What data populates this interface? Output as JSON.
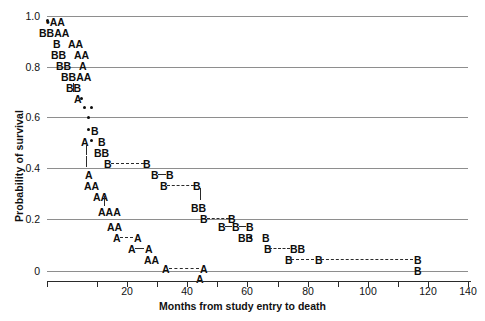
{
  "chart_data": {
    "type": "scatter",
    "title": "",
    "xlabel": "Months from study entry to death",
    "ylabel": "Probability of survival",
    "xlim": [
      0,
      140
    ],
    "ylim": [
      0,
      1.0
    ],
    "grid": true,
    "legend": "none",
    "x_ticks_major": [
      0,
      20,
      40,
      60,
      80,
      100,
      120,
      140
    ],
    "x_tick_labels": [
      "",
      "20",
      "40",
      "60",
      "80",
      "100",
      "120",
      "140"
    ],
    "x_ticks_minor_step": 10,
    "y_ticks": [
      0,
      0.2,
      0.4,
      0.6,
      0.8,
      1.0
    ],
    "y_tick_labels": [
      "0",
      "0.2",
      "0.4",
      "0.6",
      "0.8",
      "1.0"
    ],
    "series": [
      {
        "name": "A",
        "marker": "letter-A"
      },
      {
        "name": "B",
        "marker": "letter-B"
      },
      {
        "name": "dot",
        "marker": "filled-circle"
      }
    ],
    "rows": [
      {
        "y": 0.96,
        "text": "•AA",
        "x": 5
      },
      {
        "y": 0.92,
        "text": "BBAA",
        "x": 3
      },
      {
        "y": 0.88,
        "text": "B  AA",
        "x": 6
      },
      {
        "y": 0.84,
        "text": "BB  AA",
        "x": 7
      },
      {
        "y": 0.8,
        "text": "BB  A",
        "x": 8
      },
      {
        "y": 0.76,
        "text": "BBAA",
        "x": 11
      },
      {
        "y": 0.72,
        "text": "BB|",
        "x": 13
      },
      {
        "y": 0.68,
        "text": "A•",
        "x": 15
      },
      {
        "y": 0.645,
        "text": "••",
        "x": 17
      },
      {
        "y": 0.6,
        "text": "•",
        "x": 17
      },
      {
        "y": 0.565,
        "text": "•B",
        "x": 18
      },
      {
        "y": 0.525,
        "text": "A•B",
        "x": 17
      },
      {
        "y": 0.485,
        "text": "|BB",
        "x": 20
      },
      {
        "y": 0.445,
        "text": "|  B----B",
        "x": 20
      },
      {
        "y": 0.4,
        "text": "A",
        "x": 21
      },
      {
        "y": 0.4,
        "text": "B-B",
        "x": 41
      },
      {
        "y": 0.36,
        "text": "AA",
        "x": 21
      },
      {
        "y": 0.36,
        "text": "B----B",
        "x": 44
      },
      {
        "y": 0.325,
        "text": "AA",
        "x": 24
      },
      {
        "y": 0.28,
        "text": "AAA",
        "x": 26
      },
      {
        "y": 0.28,
        "text": "BB",
        "x": 62
      },
      {
        "y": 0.245,
        "text": "B---B",
        "x": 66
      },
      {
        "y": 0.2,
        "text": "AA",
        "x": 29
      },
      {
        "y": 0.2,
        "text": "B-B-B",
        "x": 72
      },
      {
        "y": 0.165,
        "text": "A--A",
        "x": 31
      },
      {
        "y": 0.165,
        "text": "BB•B",
        "x": 78
      },
      {
        "y": 0.13,
        "text": "A-A",
        "x": 36
      },
      {
        "y": 0.13,
        "text": "B---BB",
        "x": 83
      },
      {
        "y": 0.095,
        "text": "AA",
        "x": 40
      },
      {
        "y": 0.095,
        "text": "B---B---------B",
        "x": 89
      },
      {
        "y": 0.055,
        "text": "A-----A",
        "x": 43
      },
      {
        "y": 0.055,
        "text": "B",
        "x": 120
      },
      {
        "y": 0.015,
        "text": "A",
        "x": 49
      },
      {
        "y": 0.015,
        "text": "B",
        "x": 120
      }
    ]
  },
  "marks": [
    {
      "id": "r1",
      "label": "•AA",
      "left": 46,
      "top": 17
    },
    {
      "id": "r2",
      "label": "BBAA",
      "left": 39,
      "top": 28
    },
    {
      "id": "r3",
      "label": "B",
      "left": 53,
      "top": 39
    },
    {
      "id": "r3b",
      "label": "AA",
      "left": 68,
      "top": 39
    },
    {
      "id": "r4",
      "label": "BB",
      "left": 51,
      "top": 50
    },
    {
      "id": "r4b",
      "label": "AA",
      "left": 74,
      "top": 50
    },
    {
      "id": "r5",
      "label": "BB",
      "left": 56,
      "top": 61
    },
    {
      "id": "r5b",
      "label": "A",
      "left": 79,
      "top": 61
    },
    {
      "id": "r6",
      "label": "BBAA",
      "left": 61,
      "top": 72
    },
    {
      "id": "r7",
      "label": "BB",
      "left": 66,
      "top": 83
    },
    {
      "id": "r8",
      "label": "A",
      "left": 74,
      "top": 94
    },
    {
      "id": "r11",
      "label": "B",
      "left": 91,
      "top": 126
    },
    {
      "id": "r12",
      "label": "A",
      "left": 81,
      "top": 137
    },
    {
      "id": "r12b",
      "label": "B",
      "left": 98,
      "top": 137
    },
    {
      "id": "r13",
      "label": "BB",
      "left": 94,
      "top": 148
    },
    {
      "id": "r14",
      "label": "B",
      "left": 104,
      "top": 159
    },
    {
      "id": "r14b",
      "label": "B",
      "left": 143,
      "top": 159
    },
    {
      "id": "r15",
      "label": "A",
      "left": 85,
      "top": 170
    },
    {
      "id": "r15b",
      "label": "B",
      "left": 151,
      "top": 170
    },
    {
      "id": "r15c",
      "label": "B",
      "left": 166,
      "top": 170
    },
    {
      "id": "r16",
      "label": "AA",
      "left": 84,
      "top": 181
    },
    {
      "id": "r16b",
      "label": "B",
      "left": 160,
      "top": 181
    },
    {
      "id": "r16c",
      "label": "B",
      "left": 193,
      "top": 181
    },
    {
      "id": "r17",
      "label": "AA",
      "left": 93,
      "top": 192
    },
    {
      "id": "r18",
      "label": "AAA",
      "left": 98,
      "top": 207
    },
    {
      "id": "r18b",
      "label": "BB",
      "left": 191,
      "top": 203
    },
    {
      "id": "r19",
      "label": "B",
      "left": 200,
      "top": 214
    },
    {
      "id": "r19b",
      "label": "B",
      "left": 228,
      "top": 214
    },
    {
      "id": "r20",
      "label": "AA",
      "left": 107,
      "top": 222
    },
    {
      "id": "r20b",
      "label": "B",
      "left": 218,
      "top": 222
    },
    {
      "id": "r20c",
      "label": "B",
      "left": 232,
      "top": 222
    },
    {
      "id": "r20d",
      "label": "B",
      "left": 246,
      "top": 222
    },
    {
      "id": "r21",
      "label": "A",
      "left": 113,
      "top": 233
    },
    {
      "id": "r21b",
      "label": "A",
      "left": 134,
      "top": 233
    },
    {
      "id": "r21c",
      "label": "BB",
      "left": 238,
      "top": 233
    },
    {
      "id": "r21d",
      "label": "B",
      "left": 262,
      "top": 233
    },
    {
      "id": "r22",
      "label": "A",
      "left": 128,
      "top": 244
    },
    {
      "id": "r22b",
      "label": "A",
      "left": 145,
      "top": 244
    },
    {
      "id": "r22c",
      "label": "B",
      "left": 264,
      "top": 244
    },
    {
      "id": "r22d",
      "label": "BB",
      "left": 290,
      "top": 244
    },
    {
      "id": "r23",
      "label": "AA",
      "left": 144,
      "top": 255
    },
    {
      "id": "r23b",
      "label": "B",
      "left": 285,
      "top": 255
    },
    {
      "id": "r23c",
      "label": "B",
      "left": 315,
      "top": 255
    },
    {
      "id": "r23d",
      "label": "B",
      "left": 414,
      "top": 255
    },
    {
      "id": "r24",
      "label": "A",
      "left": 162,
      "top": 264
    },
    {
      "id": "r24b",
      "label": "A",
      "left": 200,
      "top": 264
    },
    {
      "id": "r24c",
      "label": "B",
      "left": 414,
      "top": 266
    },
    {
      "id": "r25",
      "label": "A",
      "left": 196,
      "top": 274
    }
  ],
  "dots": [
    {
      "id": "d1",
      "left": 46,
      "top": 19
    },
    {
      "id": "d2",
      "left": 80,
      "top": 97
    },
    {
      "id": "d3",
      "left": 83,
      "top": 106
    },
    {
      "id": "d4",
      "left": 90,
      "top": 106
    },
    {
      "id": "d5",
      "left": 87,
      "top": 116
    },
    {
      "id": "d6",
      "left": 87,
      "top": 128
    },
    {
      "id": "d7",
      "left": 90,
      "top": 139
    },
    {
      "id": "d8",
      "left": 249,
      "top": 236
    }
  ],
  "vsegs": [
    {
      "id": "v1",
      "left": 73,
      "top": 83,
      "height": 9
    },
    {
      "id": "v2",
      "left": 86,
      "top": 145,
      "height": 10
    },
    {
      "id": "v3",
      "left": 86,
      "top": 156,
      "height": 11
    },
    {
      "id": "v4",
      "left": 104,
      "top": 196,
      "height": 10
    },
    {
      "id": "v5",
      "left": 200,
      "top": 188,
      "height": 12
    }
  ],
  "hsegs_dash": [
    {
      "id": "h1",
      "left": 111,
      "top": 163,
      "width": 33
    },
    {
      "id": "h2",
      "left": 167,
      "top": 185,
      "width": 27
    },
    {
      "id": "h3",
      "left": 207,
      "top": 218,
      "width": 22
    },
    {
      "id": "h4",
      "left": 120,
      "top": 237,
      "width": 13
    },
    {
      "id": "h5",
      "left": 269,
      "top": 248,
      "width": 21
    },
    {
      "id": "h6",
      "left": 291,
      "top": 259,
      "width": 23
    },
    {
      "id": "h7",
      "left": 321,
      "top": 259,
      "width": 92
    },
    {
      "id": "h8",
      "left": 169,
      "top": 268,
      "width": 30
    }
  ],
  "hsegs_solid": [
    {
      "id": "s1",
      "left": 158,
      "top": 174,
      "width": 8
    },
    {
      "id": "s2",
      "left": 225,
      "top": 226,
      "width": 7
    },
    {
      "id": "s3",
      "left": 239,
      "top": 226,
      "width": 7
    },
    {
      "id": "s4",
      "left": 135,
      "top": 248,
      "width": 9
    },
    {
      "id": "s5",
      "left": 297,
      "top": 248,
      "width": 0
    }
  ],
  "gridlines": [
    {
      "id": "g1.0",
      "top": 16
    },
    {
      "id": "g0.8",
      "top": 67
    },
    {
      "id": "g0.6",
      "top": 117
    },
    {
      "id": "g0.4",
      "top": 168
    },
    {
      "id": "g0.2",
      "top": 219
    },
    {
      "id": "g0",
      "top": 271
    }
  ],
  "ytick_labels": [
    {
      "id": "y1.0",
      "text": "1.0",
      "top": 10
    },
    {
      "id": "y0.8",
      "text": "0.8",
      "top": 61
    },
    {
      "id": "y0.6",
      "text": "0.6",
      "top": 111
    },
    {
      "id": "y0.4",
      "text": "0.4",
      "top": 162
    },
    {
      "id": "y0.2",
      "text": "0.2",
      "top": 213
    },
    {
      "id": "y0",
      "text": "0",
      "top": 265
    }
  ],
  "xtick_labels": [
    {
      "id": "x20",
      "text": "20",
      "left": 107
    },
    {
      "id": "x40",
      "text": "40",
      "left": 167
    },
    {
      "id": "x60",
      "text": "60",
      "left": 227
    },
    {
      "id": "x80",
      "text": "80",
      "left": 288
    },
    {
      "id": "x100",
      "text": "100",
      "left": 348
    },
    {
      "id": "x120",
      "text": "120",
      "left": 408
    },
    {
      "id": "x140",
      "text": "140",
      "left": 448
    }
  ],
  "xticks": [
    {
      "id": "t0",
      "left": 47
    },
    {
      "id": "t10",
      "left": 97
    },
    {
      "id": "t20",
      "left": 127
    },
    {
      "id": "t30",
      "left": 157
    },
    {
      "id": "t40",
      "left": 187
    },
    {
      "id": "t50",
      "left": 217
    },
    {
      "id": "t60",
      "left": 247
    },
    {
      "id": "t70",
      "left": 278
    },
    {
      "id": "t80",
      "left": 308
    },
    {
      "id": "t90",
      "left": 338
    },
    {
      "id": "t100",
      "left": 368
    },
    {
      "id": "t110",
      "left": 398
    },
    {
      "id": "t120",
      "left": 428
    },
    {
      "id": "t140",
      "left": 468
    }
  ],
  "axis": {
    "y_title": "Probability of survival",
    "x_title": "Months from study entry to death"
  }
}
